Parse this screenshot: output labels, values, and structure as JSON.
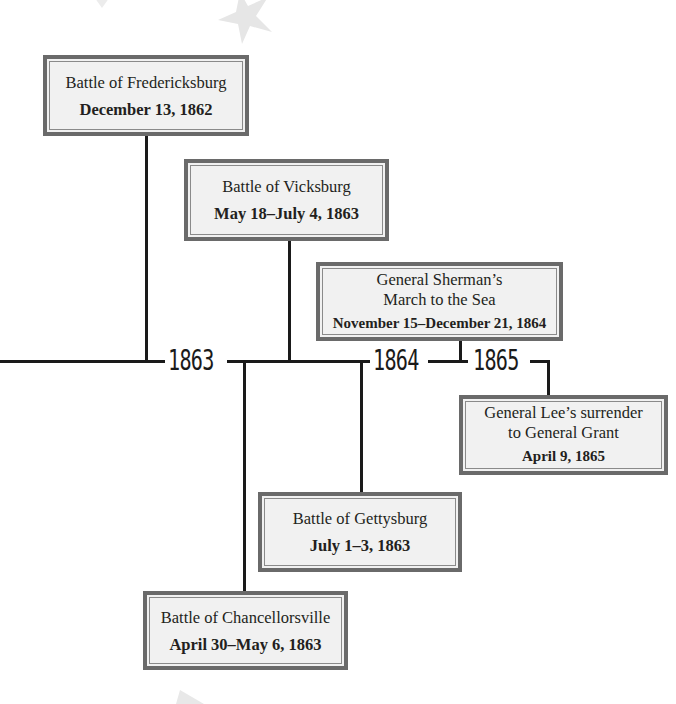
{
  "diagram": {
    "type": "timeline",
    "years": [
      {
        "label": "1863"
      },
      {
        "label": "1864"
      },
      {
        "label": "1865"
      }
    ],
    "events": [
      {
        "id": "fredericksburg",
        "title": "Battle of Fredericksburg",
        "date": "December 13, 1862",
        "position": "above"
      },
      {
        "id": "vicksburg",
        "title": "Battle of Vicksburg",
        "date": "May 18–July 4, 1863",
        "position": "above"
      },
      {
        "id": "sherman",
        "title_line1": "General Sherman’s",
        "title_line2": "March to the Sea",
        "date": "November 15–December 21, 1864",
        "position": "above"
      },
      {
        "id": "lee",
        "title_line1": "General Lee’s surrender",
        "title_line2": "to General Grant",
        "date": "April 9, 1865",
        "position": "below"
      },
      {
        "id": "gettysburg",
        "title": "Battle of Gettysburg",
        "date": "July 1–3, 1863",
        "position": "below"
      },
      {
        "id": "chancellorsville",
        "title": "Battle of Chancellorsville",
        "date": "April 30–May 6, 1863",
        "position": "below"
      }
    ],
    "colors": {
      "line": "#1a1a1a",
      "box_fill": "#f1f1f1",
      "box_border": "#6a6a6a",
      "star": "#e6e6e6"
    }
  }
}
